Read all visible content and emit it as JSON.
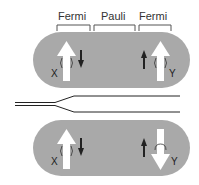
{
  "labels": {
    "fermi_left": "Fermi",
    "pauli": "Pauli",
    "fermi_right": "Fermi"
  },
  "top_pill": {
    "x_label": "X",
    "y_label": "Y",
    "left_big_arrow": "up",
    "left_small_arrow": "down",
    "right_small_arrow": "up",
    "right_big_arrow": "up"
  },
  "bottom_pill": {
    "x_label": "X",
    "y_label": "Y",
    "left_big_arrow": "up",
    "left_small_arrow": "down",
    "right_small_arrow": "up",
    "right_big_arrow": "down"
  },
  "colors": {
    "pill_fill": "#a9a9a9",
    "big_arrow": "#ffffff",
    "small_arrow": "#222222",
    "line": "#222222",
    "bracket": "#555555"
  }
}
